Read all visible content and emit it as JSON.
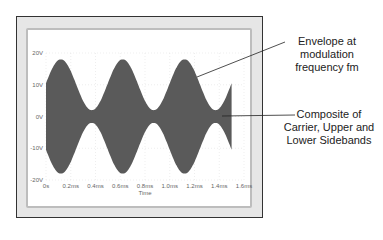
{
  "chart_data": {
    "type": "area",
    "title": "",
    "xlabel": "Time",
    "ylabel": "",
    "x_ticks": [
      "0s",
      "0.2ms",
      "0.4ms",
      "0.6ms",
      "0.8ms",
      "1.0ms",
      "1.2ms",
      "1.4ms",
      "1.6ms"
    ],
    "y_ticks": [
      "20V",
      "10V",
      "0V",
      "-10V",
      "-20V"
    ],
    "xlim": [
      0,
      1.6
    ],
    "ylim": [
      -20,
      20
    ],
    "grid": true,
    "series": [
      {
        "name": "AM signal (carrier + sidebands)",
        "envelope_max_V": 18,
        "envelope_min_V": 2,
        "envelope_start_V": 10,
        "modulation_period_ms": 0.5,
        "envelope_peaks_ms": [
          0.12,
          0.62,
          1.12
        ],
        "envelope_troughs_ms": [
          0.37,
          0.87,
          1.37
        ],
        "end_time_ms": 1.5,
        "color": "#5a5a5a"
      }
    ],
    "annotations": [
      {
        "text": "Envelope at modulation frequency fm"
      },
      {
        "text": "Composite of Carrier, Upper and Lower Sidebands"
      }
    ]
  },
  "annotations": {
    "envelope": [
      "Envelope at",
      "modulation",
      "frequency fm"
    ],
    "composite": [
      "Composite of",
      "Carrier, Upper and",
      "Lower Sidebands"
    ]
  },
  "axis": {
    "x_label": "Time",
    "x_ticks": [
      "0s",
      "0.2ms",
      "0.4ms",
      "0.6ms",
      "0.8ms",
      "1.0ms",
      "1.2ms",
      "1.4ms",
      "1.6ms"
    ],
    "y_ticks": [
      "20V",
      "10V",
      "0V",
      "-10V",
      "-20V"
    ]
  },
  "colors": {
    "signal": "#5a5a5a",
    "frame": "#333333",
    "grid": "#dddddd"
  }
}
